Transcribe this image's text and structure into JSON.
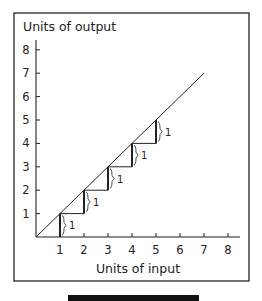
{
  "chart_data": {
    "type": "line",
    "title": "",
    "xlabel": "Units of input",
    "ylabel": "Units of output",
    "x_ticks": [
      "1",
      "2",
      "3",
      "4",
      "5",
      "6",
      "7",
      "8"
    ],
    "y_ticks": [
      "1",
      "2",
      "3",
      "4",
      "5",
      "6",
      "7",
      "8"
    ],
    "xlim": [
      0,
      8.5
    ],
    "ylim": [
      0,
      8.5
    ],
    "grid": false,
    "series": [
      {
        "name": "Total output (constant returns)",
        "x": [
          0,
          7
        ],
        "y": [
          0,
          7
        ]
      }
    ],
    "steps": [
      {
        "x_from": 0,
        "x_to": 1,
        "y_from": 0,
        "y_to": 1,
        "increment_label": "1"
      },
      {
        "x_from": 1,
        "x_to": 2,
        "y_from": 1,
        "y_to": 2,
        "increment_label": "1"
      },
      {
        "x_from": 2,
        "x_to": 3,
        "y_from": 2,
        "y_to": 3,
        "increment_label": "1"
      },
      {
        "x_from": 3,
        "x_to": 4,
        "y_from": 3,
        "y_to": 4,
        "increment_label": "1"
      },
      {
        "x_from": 4,
        "x_to": 5,
        "y_from": 4,
        "y_to": 5,
        "increment_label": "1"
      }
    ]
  }
}
